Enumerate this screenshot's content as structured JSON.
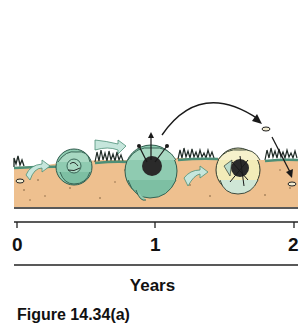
{
  "diagram": {
    "stages": [
      {
        "name": "seed",
        "position_year": 0
      },
      {
        "name": "juvenile-rosette",
        "position_year": 0.45
      },
      {
        "name": "flowering-rosette",
        "position_year": 1
      },
      {
        "name": "dying-rosette",
        "position_year": 1.6
      },
      {
        "name": "dispersed-seed",
        "position_year": 2
      }
    ],
    "colors": {
      "soil": "#eec08f",
      "soil_dots": "#7a5a3a",
      "leaf": "#8fcbb1",
      "leaf_dark": "#4d8f77",
      "leaf_dead": "#f2ecb8",
      "grass": "#1f2a26",
      "arrow_fill": "#c6e6dc",
      "outline": "#1a1a1a"
    }
  },
  "axis": {
    "ticks": [
      "0",
      "1",
      "2"
    ],
    "title": "Years"
  },
  "caption": "Figure 14.34(a)"
}
